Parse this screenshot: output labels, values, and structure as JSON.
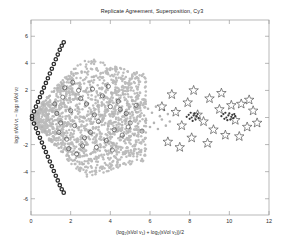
{
  "chart": {
    "title": "Replicate Agreement, Superposition, Cy3",
    "xlabel_plain": "(log2(sVol v1) + log2(sVol v2))/2",
    "ylabel_plain": "log2 sVol v1 - log2 sVol v2"
  },
  "chart_data": {
    "type": "scatter",
    "title": "Replicate Agreement, Superposition, Cy3",
    "xlabel": "(log2(sVol v1) + log2(sVol v2))/2",
    "ylabel": "log2 sVol v1 - log2 sVol v2",
    "xlim": [
      0,
      12
    ],
    "ylim": [
      -7.2,
      7.2
    ],
    "xticks": [
      0,
      2,
      4,
      6,
      8,
      10,
      12
    ],
    "yticks": [
      6,
      4,
      2,
      0,
      -2,
      -4,
      -6
    ],
    "grid": false,
    "legend": false,
    "series": [
      {
        "name": "light-gray-dots",
        "marker": "dot",
        "color": "#b4b4b4",
        "size": 2.6,
        "comment": "dense diffuse cloud filling the wedge between x=0 and x=6",
        "points": [
          [
            0.35,
            0.3
          ],
          [
            0.4,
            -0.35
          ],
          [
            0.5,
            0.6
          ],
          [
            0.55,
            -0.7
          ],
          [
            0.62,
            0.95
          ],
          [
            0.7,
            -1.0
          ],
          [
            0.75,
            1.25
          ],
          [
            0.8,
            -1.3
          ],
          [
            0.85,
            0.2
          ],
          [
            0.9,
            -0.2
          ],
          [
            0.95,
            1.6
          ],
          [
            1.0,
            -1.65
          ],
          [
            1.05,
            0.45
          ],
          [
            1.1,
            -0.5
          ],
          [
            1.15,
            1.9
          ],
          [
            1.2,
            -1.95
          ],
          [
            1.25,
            0.8
          ],
          [
            1.3,
            -0.85
          ],
          [
            1.35,
            2.2
          ],
          [
            1.4,
            -2.25
          ],
          [
            1.45,
            0.1
          ],
          [
            1.5,
            -0.1
          ],
          [
            1.55,
            2.5
          ],
          [
            1.6,
            -2.55
          ],
          [
            1.65,
            1.1
          ],
          [
            1.7,
            -1.15
          ],
          [
            1.75,
            0.55
          ],
          [
            1.8,
            -0.6
          ],
          [
            1.85,
            2.8
          ],
          [
            1.9,
            -2.85
          ],
          [
            1.95,
            1.45
          ],
          [
            2.0,
            -1.5
          ],
          [
            2.05,
            0.25
          ],
          [
            2.1,
            -0.3
          ],
          [
            2.15,
            3.1
          ],
          [
            2.2,
            -3.15
          ],
          [
            2.25,
            1.75
          ],
          [
            2.3,
            -1.8
          ],
          [
            2.35,
            0.7
          ],
          [
            2.4,
            -0.75
          ],
          [
            2.45,
            2.35
          ],
          [
            2.5,
            -2.4
          ],
          [
            2.55,
            3.4
          ],
          [
            2.6,
            -3.45
          ],
          [
            2.65,
            0.05
          ],
          [
            2.7,
            -0.05
          ],
          [
            2.75,
            1.95
          ],
          [
            2.8,
            -2.0
          ],
          [
            2.85,
            1.0
          ],
          [
            2.9,
            -1.05
          ],
          [
            2.95,
            2.65
          ],
          [
            3.0,
            -2.7
          ],
          [
            3.05,
            0.4
          ],
          [
            3.1,
            -0.45
          ],
          [
            3.15,
            3.0
          ],
          [
            3.2,
            -3.05
          ],
          [
            3.25,
            1.3
          ],
          [
            3.3,
            -1.35
          ],
          [
            3.35,
            0.85
          ],
          [
            3.4,
            -0.9
          ],
          [
            3.45,
            2.15
          ],
          [
            3.5,
            -2.2
          ],
          [
            3.55,
            0.15
          ],
          [
            3.6,
            -0.15
          ],
          [
            3.65,
            1.6
          ],
          [
            3.7,
            -1.65
          ],
          [
            3.75,
            2.45
          ],
          [
            3.8,
            -2.5
          ],
          [
            3.85,
            0.6
          ],
          [
            3.9,
            -0.65
          ],
          [
            3.95,
            1.15
          ],
          [
            4.0,
            -1.2
          ],
          [
            4.05,
            1.85
          ],
          [
            4.1,
            -1.9
          ],
          [
            4.15,
            0.3
          ],
          [
            4.2,
            -0.35
          ],
          [
            4.25,
            2.05
          ],
          [
            4.3,
            -2.1
          ],
          [
            4.35,
            0.95
          ],
          [
            4.4,
            -1.0
          ],
          [
            4.45,
            1.4
          ],
          [
            4.5,
            -1.45
          ],
          [
            4.55,
            0.5
          ],
          [
            4.6,
            -0.55
          ],
          [
            4.65,
            1.7
          ],
          [
            4.7,
            -1.75
          ],
          [
            4.75,
            0.2
          ],
          [
            4.8,
            -0.25
          ],
          [
            4.85,
            1.05
          ],
          [
            4.9,
            -1.1
          ],
          [
            4.95,
            0.75
          ],
          [
            5.0,
            -0.8
          ],
          [
            5.1,
            1.25
          ],
          [
            5.2,
            -1.3
          ],
          [
            5.3,
            0.4
          ],
          [
            5.4,
            -0.45
          ],
          [
            5.5,
            0.9
          ],
          [
            5.6,
            -0.95
          ],
          [
            5.7,
            0.15
          ],
          [
            5.8,
            -0.2
          ],
          [
            5.9,
            0.65
          ],
          [
            6.0,
            -0.7
          ],
          [
            6.1,
            0.35
          ],
          [
            6.2,
            -0.4
          ],
          [
            6.3,
            0.8
          ],
          [
            6.4,
            -0.85
          ],
          [
            6.5,
            0.1
          ],
          [
            6.6,
            -0.15
          ],
          [
            6.7,
            0.55
          ],
          [
            6.8,
            -0.6
          ],
          [
            6.9,
            0.25
          ],
          [
            7.0,
            -0.3
          ]
        ]
      },
      {
        "name": "open-circles",
        "marker": "circle",
        "color": "#4a4a4a",
        "size": 4.2,
        "comment": "medium open circles overlaid on the cloud",
        "points": [
          [
            1.2,
            1.0
          ],
          [
            1.4,
            -1.1
          ],
          [
            1.6,
            1.5
          ],
          [
            1.8,
            -1.6
          ],
          [
            2.0,
            0.5
          ],
          [
            2.2,
            -0.6
          ],
          [
            2.4,
            2.0
          ],
          [
            2.6,
            -2.1
          ],
          [
            2.8,
            1.0
          ],
          [
            3.0,
            -1.1
          ],
          [
            3.2,
            0.2
          ],
          [
            3.4,
            -0.3
          ],
          [
            3.6,
            1.6
          ],
          [
            3.8,
            -1.7
          ],
          [
            4.0,
            0.8
          ],
          [
            4.2,
            -0.9
          ],
          [
            4.4,
            1.2
          ],
          [
            4.6,
            -1.3
          ],
          [
            4.8,
            0.3
          ],
          [
            5.0,
            -0.4
          ],
          [
            2.1,
            2.6
          ],
          [
            2.3,
            -2.7
          ],
          [
            1.7,
            2.2
          ],
          [
            1.9,
            -2.3
          ],
          [
            3.1,
            2.1
          ],
          [
            3.3,
            -2.2
          ],
          [
            2.5,
            1.4
          ],
          [
            2.7,
            -1.5
          ],
          [
            4.5,
            0.6
          ],
          [
            4.9,
            -0.7
          ],
          [
            5.3,
            0.9
          ],
          [
            5.6,
            -1.0
          ],
          [
            3.9,
            2.3
          ],
          [
            4.1,
            -2.4
          ],
          [
            1.3,
            0.3
          ],
          [
            1.5,
            -0.4
          ]
        ]
      },
      {
        "name": "wedge-edge-dark-circles",
        "marker": "circle-filled",
        "color": "#2b2b2b",
        "size": 3.4,
        "comment": "dense dark circles tracing the upper and lower wedge boundaries, vertex at x=0",
        "points": [
          [
            0.05,
            0.1
          ],
          [
            0.15,
            0.45
          ],
          [
            0.25,
            0.8
          ],
          [
            0.35,
            1.15
          ],
          [
            0.45,
            1.5
          ],
          [
            0.55,
            1.85
          ],
          [
            0.65,
            2.2
          ],
          [
            0.75,
            2.55
          ],
          [
            0.85,
            2.9
          ],
          [
            0.95,
            3.25
          ],
          [
            1.05,
            3.6
          ],
          [
            1.15,
            3.95
          ],
          [
            1.25,
            4.3
          ],
          [
            1.35,
            4.65
          ],
          [
            1.45,
            5.0
          ],
          [
            1.55,
            5.3
          ],
          [
            1.65,
            5.55
          ],
          [
            0.05,
            -0.1
          ],
          [
            0.15,
            -0.45
          ],
          [
            0.25,
            -0.8
          ],
          [
            0.35,
            -1.15
          ],
          [
            0.45,
            -1.5
          ],
          [
            0.55,
            -1.85
          ],
          [
            0.65,
            -2.2
          ],
          [
            0.75,
            -2.55
          ],
          [
            0.85,
            -2.9
          ],
          [
            0.95,
            -3.25
          ],
          [
            1.05,
            -3.6
          ],
          [
            1.15,
            -3.95
          ],
          [
            1.25,
            -4.3
          ],
          [
            1.35,
            -4.65
          ],
          [
            1.45,
            -5.0
          ],
          [
            1.55,
            -5.3
          ],
          [
            1.65,
            -5.55
          ]
        ]
      },
      {
        "name": "stars",
        "marker": "star",
        "color": "#3a3a3a",
        "size": 5,
        "comment": "pentagram markers spread across the right half",
        "points": [
          [
            7.3,
            0.4
          ],
          [
            7.6,
            -0.6
          ],
          [
            7.9,
            1.1
          ],
          [
            8.1,
            -1.5
          ],
          [
            8.4,
            0.2
          ],
          [
            8.7,
            -0.3
          ],
          [
            9.0,
            1.4
          ],
          [
            9.2,
            -0.9
          ],
          [
            9.5,
            0.6
          ],
          [
            9.8,
            -1.3
          ],
          [
            10.1,
            0.9
          ],
          [
            10.3,
            -0.2
          ],
          [
            10.6,
            1.0
          ],
          [
            10.9,
            -0.7
          ],
          [
            11.2,
            0.5
          ],
          [
            6.9,
            -1.8
          ],
          [
            7.1,
            1.7
          ],
          [
            8.9,
            -1.9
          ],
          [
            9.6,
            1.8
          ],
          [
            10.5,
            -1.4
          ],
          [
            11.0,
            1.3
          ],
          [
            7.5,
            -2.2
          ],
          [
            8.2,
            2.0
          ],
          [
            6.6,
            0.8
          ],
          [
            11.4,
            -0.4
          ]
        ]
      },
      {
        "name": "right-cluster-dots",
        "marker": "dot",
        "color": "#3a3a3a",
        "size": 2.2,
        "comment": "two tight dark clusters around x=8 and x=10 near y=0",
        "points": [
          [
            7.85,
            0.05
          ],
          [
            7.95,
            0.2
          ],
          [
            8.0,
            -0.1
          ],
          [
            8.05,
            0.35
          ],
          [
            8.1,
            0.0
          ],
          [
            8.15,
            -0.25
          ],
          [
            8.2,
            0.15
          ],
          [
            8.25,
            0.3
          ],
          [
            8.3,
            -0.15
          ],
          [
            8.35,
            0.1
          ],
          [
            8.4,
            0.25
          ],
          [
            8.45,
            -0.05
          ],
          [
            9.6,
            0.1
          ],
          [
            9.7,
            0.25
          ],
          [
            9.75,
            -0.1
          ],
          [
            9.8,
            0.35
          ],
          [
            9.85,
            0.0
          ],
          [
            9.9,
            -0.2
          ],
          [
            9.95,
            0.15
          ],
          [
            10.0,
            0.3
          ],
          [
            10.05,
            -0.15
          ],
          [
            10.1,
            0.05
          ],
          [
            10.15,
            0.2
          ],
          [
            10.2,
            -0.05
          ],
          [
            10.25,
            0.25
          ],
          [
            10.3,
            0.1
          ]
        ]
      }
    ]
  }
}
